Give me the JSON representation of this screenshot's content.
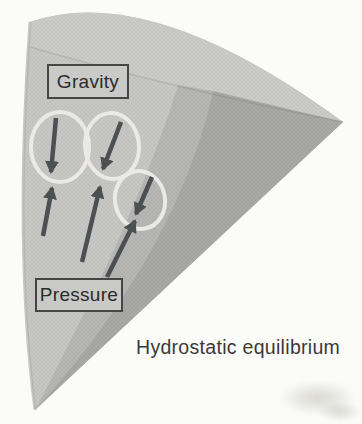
{
  "figure": {
    "caption": "Hydrostatic equilibrium"
  },
  "labels": {
    "gravity": "Gravity",
    "pressure": "Pressure"
  },
  "diagram": {
    "type": "physics-force-diagram",
    "elements": {
      "wedge_faces": 4,
      "mass_element_circles": 3,
      "gravity_arrows": 3,
      "pressure_arrows": 3
    },
    "colors": {
      "background": "#fbfbf8",
      "wedge_front": "#c7c7c5",
      "wedge_top": "#cbcbc9",
      "wedge_mid": "#b6b6b4",
      "wedge_side": "#a8a8a6",
      "edge_shade": "#b2b2b0",
      "circle_ring": "#edece8",
      "arrow": "#4c5053",
      "label_border": "#454545",
      "label_fill": "#c9c9c7",
      "text": "#2b2b2b"
    }
  }
}
